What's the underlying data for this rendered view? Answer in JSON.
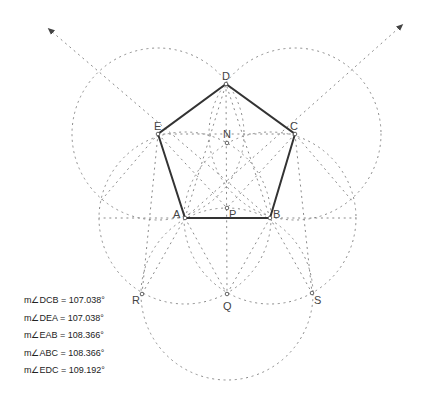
{
  "diagram": {
    "points": [
      {
        "name": "A",
        "x": 185,
        "y": 218
      },
      {
        "name": "B",
        "x": 270,
        "y": 218
      },
      {
        "name": "C",
        "x": 295,
        "y": 134
      },
      {
        "name": "D",
        "x": 226,
        "y": 84
      },
      {
        "name": "E",
        "x": 158,
        "y": 134
      },
      {
        "name": "N",
        "x": 227,
        "y": 143
      },
      {
        "name": "P",
        "x": 227,
        "y": 208
      },
      {
        "name": "Q",
        "x": 227,
        "y": 294
      },
      {
        "name": "R",
        "x": 142,
        "y": 294
      },
      {
        "name": "S",
        "x": 312,
        "y": 293
      }
    ],
    "labels": {
      "A": "A",
      "B": "B",
      "C": "C",
      "D": "D",
      "E": "E",
      "N": "N",
      "P": "P",
      "Q": "Q",
      "R": "R",
      "S": "S"
    },
    "polygon": [
      "A",
      "B",
      "C",
      "D",
      "E"
    ],
    "circle_radius": 86,
    "circle_centers": [
      "A",
      "B",
      "C",
      "E",
      "Q"
    ],
    "rays": [
      {
        "from": "B",
        "through": "E",
        "arrow_at": [
          50,
          30
        ]
      },
      {
        "from": "A",
        "through": "C",
        "arrow_at": [
          401,
          26
        ]
      }
    ],
    "colors": {
      "polygon_stroke": "#333333",
      "construction_stroke": "#8a8a8a",
      "text": "#222222"
    }
  },
  "measurements": [
    {
      "label": "m∠DCB = 107.038°"
    },
    {
      "label": "m∠DEA = 107.038°"
    },
    {
      "label": "m∠EAB = 108.366°"
    },
    {
      "label": "m∠ABC = 108.366°"
    },
    {
      "label": "m∠EDC = 109.192°"
    }
  ]
}
